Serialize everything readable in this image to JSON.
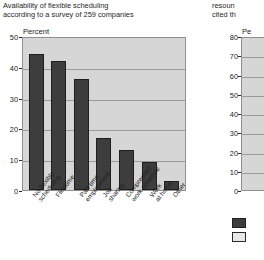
{
  "left": {
    "caption_line1": "Availability of flexible scheduling",
    "caption_line2": "according to a survey of 259 companies",
    "axis_title": "Percent"
  },
  "right": {
    "caption_line1": "resoun",
    "caption_line2": "cited th",
    "axis_title": "Pe"
  },
  "colors": {
    "bar": "#3d3d3d",
    "bar_border": "#1f1f1f",
    "plot_background": "#d6d6d6",
    "gridline": "#9a9a9a",
    "frame": "#8f8f8f",
    "text": "#1a1a1a"
  },
  "chart_data": [
    {
      "type": "bar",
      "title": "Availability of flexible scheduling according to a survey of 259 companies",
      "xlabel": "",
      "ylabel": "Percent",
      "ylim": [
        0,
        50
      ],
      "yticks": [
        0,
        10,
        20,
        30,
        40,
        50
      ],
      "grid": true,
      "legend": "none",
      "categories": [
        "No flexible\nscheduling",
        "Flexitime",
        "Part-time\nemployment",
        "Job\nsharing",
        "Compressed\nwork schedule",
        "Work\nat home",
        "Other"
      ],
      "values": [
        44,
        42,
        36,
        17,
        13,
        9,
        3
      ]
    },
    {
      "type": "bar",
      "title": "resoun cited th",
      "xlabel": "",
      "ylabel": "Pe",
      "ylim": [
        0,
        80
      ],
      "yticks": [
        0,
        10,
        20,
        30,
        40,
        50,
        60,
        70,
        80
      ],
      "grid": true,
      "legend": "bottom",
      "categories": [],
      "values": [],
      "note": "chart clipped at right edge of image; only y-axis and legend swatches visible"
    }
  ],
  "left_yticks": [
    {
      "label": "50",
      "value": 50
    },
    {
      "label": "40",
      "value": 40
    },
    {
      "label": "30",
      "value": 30
    },
    {
      "label": "20",
      "value": 20
    },
    {
      "label": "10",
      "value": 10
    },
    {
      "label": "0",
      "value": 0
    }
  ],
  "right_yticks": [
    {
      "label": "80",
      "value": 80
    },
    {
      "label": "70",
      "value": 70
    },
    {
      "label": "60",
      "value": 60
    },
    {
      "label": "50",
      "value": 50
    },
    {
      "label": "40",
      "value": 40
    },
    {
      "label": "30",
      "value": 30
    },
    {
      "label": "20",
      "value": 20
    },
    {
      "label": "10",
      "value": 10
    },
    {
      "label": "0",
      "value": 0
    }
  ]
}
